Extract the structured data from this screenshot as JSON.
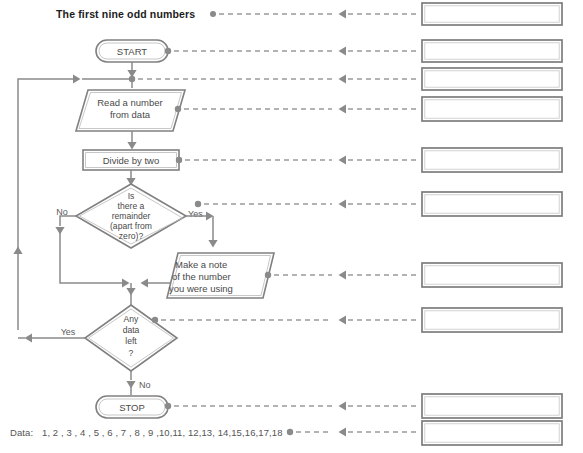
{
  "page": {
    "width": 583,
    "height": 453,
    "background": "#ffffff",
    "line_color": "#8a8a8a",
    "shape_stroke": "#808080",
    "text_color": "#4a4a4a",
    "title_color": "#1c1c1c"
  },
  "title": {
    "text": "The first nine odd numbers"
  },
  "flowchart": {
    "type": "flowchart",
    "nodes": [
      {
        "id": "start",
        "shape": "terminator",
        "label": "START"
      },
      {
        "id": "read",
        "shape": "parallelogram",
        "label_line1": "Read a number",
        "label_line2": "from data"
      },
      {
        "id": "divide",
        "shape": "rectangle",
        "label": "Divide by two"
      },
      {
        "id": "remainder",
        "shape": "diamond",
        "label_line1": "Is",
        "label_line2": "there a",
        "label_line3": "remainder",
        "label_line4": "(apart from",
        "label_line5": "zero)?"
      },
      {
        "id": "note",
        "shape": "parallelogram",
        "label_line1": "Make a note",
        "label_line2": "of the number",
        "label_line3": "you were using"
      },
      {
        "id": "anydata",
        "shape": "diamond",
        "label_line1": "Any",
        "label_line2": "data",
        "label_line3": "left",
        "label_line4": "?"
      },
      {
        "id": "stop",
        "shape": "terminator",
        "label": "STOP"
      }
    ],
    "branch_labels": {
      "remainder_no": "No",
      "remainder_yes": "Yes",
      "anydata_yes": "Yes",
      "anydata_no": "No"
    }
  },
  "data_line": {
    "label": "Data:",
    "values": "1, 2 , 3 , 4 , 5 , 6 , 7 , 8 , 9 ,10,11, 12,13, 14,15,16,17,18"
  },
  "answer_boxes": [
    {
      "id": "answer-1",
      "value": ""
    },
    {
      "id": "answer-2",
      "value": ""
    },
    {
      "id": "answer-3",
      "value": ""
    },
    {
      "id": "answer-4",
      "value": ""
    },
    {
      "id": "answer-5",
      "value": ""
    },
    {
      "id": "answer-6",
      "value": ""
    },
    {
      "id": "answer-7",
      "value": ""
    },
    {
      "id": "answer-8",
      "value": ""
    },
    {
      "id": "answer-9",
      "value": ""
    },
    {
      "id": "answer-10",
      "value": ""
    }
  ]
}
